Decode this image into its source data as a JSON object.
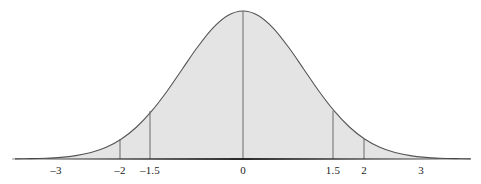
{
  "figure": {
    "title": "",
    "background_color": "#ffffff"
  },
  "chart_data": {
    "type": "area",
    "title": "",
    "subtitle": "",
    "xlabel": "",
    "ylabel": "",
    "distribution": "standard normal (mean 0, standard deviation 1)",
    "grid": false,
    "legend": null,
    "xlim": [
      -3.75,
      3.75
    ],
    "ylim": [
      0,
      0.4
    ],
    "axis_line_visible": true,
    "y_axis_visible": false,
    "fill_color": "#e4e4e4",
    "curve_color": "#555555",
    "axis_color": "#2b2b2b",
    "vline_color": "#6a6a6a",
    "tick_labels": [
      "–3",
      "–2",
      "–1.5",
      "0",
      "1.5",
      "2",
      "3"
    ],
    "tick_values": [
      -3,
      -2,
      -1.5,
      0,
      1.5,
      2,
      3
    ],
    "tick_positions_px": [
      56,
      120,
      150,
      243,
      333,
      364,
      421
    ],
    "vertical_lines": [
      {
        "label": "–2",
        "value": -2,
        "x_px": 120,
        "height_fraction": 0.135
      },
      {
        "label": "–1.5",
        "value": -1.5,
        "x_px": 150,
        "height_fraction": 0.325
      },
      {
        "label": "0",
        "value": 0,
        "x_px": 243,
        "height_fraction": 1.0
      },
      {
        "label": "1.5",
        "value": 1.5,
        "x_px": 333,
        "height_fraction": 0.325
      },
      {
        "label": "2",
        "value": 2,
        "x_px": 364,
        "height_fraction": 0.135
      }
    ],
    "x": [
      -3.75,
      -3.5,
      -3.25,
      -3.0,
      -2.75,
      -2.5,
      -2.25,
      -2.0,
      -1.75,
      -1.5,
      -1.25,
      -1.0,
      -0.75,
      -0.5,
      -0.25,
      0.0,
      0.25,
      0.5,
      0.75,
      1.0,
      1.25,
      1.5,
      1.75,
      2.0,
      2.25,
      2.5,
      2.75,
      3.0,
      3.25,
      3.5,
      3.75
    ],
    "values": [
      0.0004,
      0.0009,
      0.002,
      0.0044,
      0.0091,
      0.0175,
      0.0317,
      0.054,
      0.0863,
      0.1295,
      0.1826,
      0.242,
      0.3011,
      0.3521,
      0.3867,
      0.3989,
      0.3867,
      0.3521,
      0.3011,
      0.242,
      0.1826,
      0.1295,
      0.0863,
      0.054,
      0.0317,
      0.0175,
      0.0091,
      0.0044,
      0.002,
      0.0009,
      0.0004
    ]
  }
}
